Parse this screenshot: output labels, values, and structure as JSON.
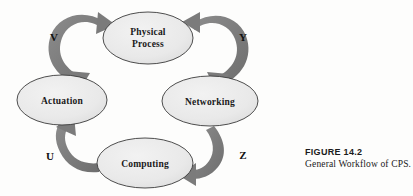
{
  "figure": {
    "caption_title": "FIGURE 14.2",
    "caption_text": "General Workflow of CPS.",
    "colors": {
      "node_fill": "#e9e9e9",
      "node_stroke": "#3a3a3a",
      "arrow_fill": "#7e7e7e",
      "text": "#1a1a1a",
      "background": "#fdfdfc"
    }
  },
  "diagram": {
    "type": "cycle-workflow",
    "nodes": [
      {
        "id": "physical-process",
        "label_line1": "Physical",
        "label_line2": "Process",
        "cx": 148,
        "cy": 38,
        "rx": 45,
        "ry": 26
      },
      {
        "id": "networking",
        "label_line1": "Networking",
        "label_line2": "",
        "cx": 210,
        "cy": 101,
        "rx": 48,
        "ry": 25
      },
      {
        "id": "computing",
        "label_line1": "Computing",
        "label_line2": "",
        "cx": 145,
        "cy": 163,
        "rx": 48,
        "ry": 25
      },
      {
        "id": "actuation",
        "label_line1": "Actuation",
        "label_line2": "",
        "cx": 62,
        "cy": 100,
        "rx": 45,
        "ry": 25
      }
    ],
    "edges": [
      {
        "id": "edge-v",
        "label": "V",
        "from": "actuation",
        "to": "physical-process",
        "label_x": 54,
        "label_y": 41
      },
      {
        "id": "edge-y",
        "label": "Y",
        "from": "physical-process",
        "to": "networking",
        "label_x": 243,
        "label_y": 41
      },
      {
        "id": "edge-z",
        "label": "Z",
        "from": "networking",
        "to": "computing",
        "label_x": 243,
        "label_y": 159
      },
      {
        "id": "edge-u",
        "label": "U",
        "from": "computing",
        "to": "actuation",
        "label_x": 50,
        "label_y": 160
      }
    ]
  }
}
